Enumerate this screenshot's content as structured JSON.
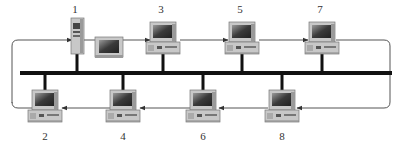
{
  "diagram": {
    "title": "",
    "topology": "token passing over bus (logical ring on physical bus)",
    "colors": {
      "bus": "#111111",
      "ring": "#555555",
      "monitor_body": "#c8c8c8",
      "monitor_shade": "#9a9a9a",
      "screen": "#3a3a3a",
      "screen_glare": "#8a8a8a",
      "label": "#333333"
    },
    "nodes": [
      {
        "id": "1",
        "label": "1",
        "row": "top",
        "kind": "server-tower"
      },
      {
        "id": "3",
        "label": "3",
        "row": "top",
        "kind": "workstation"
      },
      {
        "id": "5",
        "label": "5",
        "row": "top",
        "kind": "workstation"
      },
      {
        "id": "7",
        "label": "7",
        "row": "top",
        "kind": "workstation"
      },
      {
        "id": "2",
        "label": "2",
        "row": "bottom",
        "kind": "workstation"
      },
      {
        "id": "4",
        "label": "4",
        "row": "bottom",
        "kind": "workstation"
      },
      {
        "id": "6",
        "label": "6",
        "row": "bottom",
        "kind": "workstation"
      },
      {
        "id": "8",
        "label": "8",
        "row": "bottom",
        "kind": "workstation"
      }
    ],
    "ring_order": [
      "1",
      "3",
      "5",
      "7",
      "8",
      "6",
      "4",
      "2",
      "1"
    ],
    "extras": [
      {
        "kind": "monitor",
        "attached_to": "1"
      }
    ]
  }
}
